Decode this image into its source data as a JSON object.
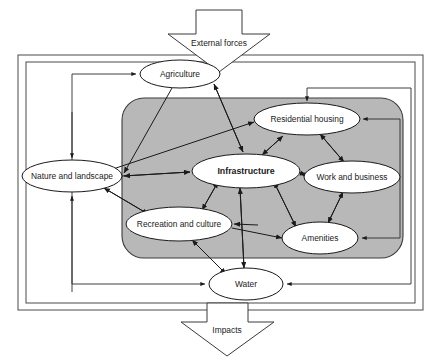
{
  "diagram": {
    "external_arrow": {
      "label": "External forces",
      "name": "external-forces-arrow"
    },
    "impacts_arrow": {
      "label": "Impacts",
      "name": "impacts-arrow"
    },
    "outer_frame": {
      "name": "system-boundary-frame"
    },
    "gray_zone": {
      "name": "core-subsystem-zone",
      "color": "#b8b8b8"
    },
    "nodes": [
      {
        "id": "agriculture",
        "label": "Agriculture",
        "cx": 180,
        "cy": 74,
        "rx": 40,
        "ry": 14,
        "bold": false,
        "inside_gray": false
      },
      {
        "id": "nature",
        "label": "Nature and landscape",
        "cx": 72,
        "cy": 176,
        "rx": 50,
        "ry": 16,
        "bold": false,
        "inside_gray": false
      },
      {
        "id": "water",
        "label": "Water",
        "cx": 246,
        "cy": 284,
        "rx": 37,
        "ry": 16,
        "bold": false,
        "inside_gray": false
      },
      {
        "id": "residential",
        "label": "Residential housing",
        "cx": 307,
        "cy": 119,
        "rx": 53,
        "ry": 16,
        "bold": false,
        "inside_gray": true
      },
      {
        "id": "infrastructure",
        "label": "Infrastructure",
        "cx": 246,
        "cy": 171,
        "rx": 54,
        "ry": 17,
        "bold": true,
        "inside_gray": true
      },
      {
        "id": "work",
        "label": "Work and business",
        "cx": 352,
        "cy": 177,
        "rx": 48,
        "ry": 16,
        "bold": false,
        "inside_gray": true
      },
      {
        "id": "recreation",
        "label": "Recreation and culture",
        "cx": 179,
        "cy": 224,
        "rx": 53,
        "ry": 17,
        "bold": false,
        "inside_gray": true
      },
      {
        "id": "amenities",
        "label": "Amenities",
        "cx": 320,
        "cy": 238,
        "rx": 38,
        "ry": 16,
        "bold": false,
        "inside_gray": true
      }
    ],
    "edges": [
      {
        "from": "agriculture",
        "to": "infrastructure",
        "type": "double"
      },
      {
        "from": "agriculture",
        "to": "nature",
        "type": "single"
      },
      {
        "from": "nature",
        "to": "residential",
        "type": "single"
      },
      {
        "from": "nature",
        "to": "infrastructure",
        "type": "double"
      },
      {
        "from": "nature",
        "to": "recreation",
        "type": "double"
      },
      {
        "from": "infrastructure",
        "to": "residential",
        "type": "double"
      },
      {
        "from": "infrastructure",
        "to": "work",
        "type": "double"
      },
      {
        "from": "infrastructure",
        "to": "recreation",
        "type": "double"
      },
      {
        "from": "infrastructure",
        "to": "amenities",
        "type": "double"
      },
      {
        "from": "infrastructure",
        "to": "water",
        "type": "double"
      },
      {
        "from": "residential",
        "to": "work",
        "type": "double"
      },
      {
        "from": "residential",
        "to": "amenities",
        "type": "double"
      },
      {
        "from": "work",
        "to": "amenities",
        "type": "double"
      },
      {
        "from": "recreation",
        "to": "water",
        "type": "double"
      },
      {
        "from": "recreation",
        "to": "amenities",
        "type": "single"
      }
    ],
    "feedback_loops": [
      {
        "name": "left-loop-to-agriculture",
        "description": "left vertical channel feeding Agriculture, Nature and Water"
      },
      {
        "name": "right-loop-residential-to-amenities",
        "description": "Residential housing out to right and back into Amenities"
      },
      {
        "name": "right-loop-to-water",
        "description": "outer right channel returning into Water"
      },
      {
        "name": "top-loop-to-residential",
        "description": "top channel entering Residential housing from above"
      }
    ]
  }
}
